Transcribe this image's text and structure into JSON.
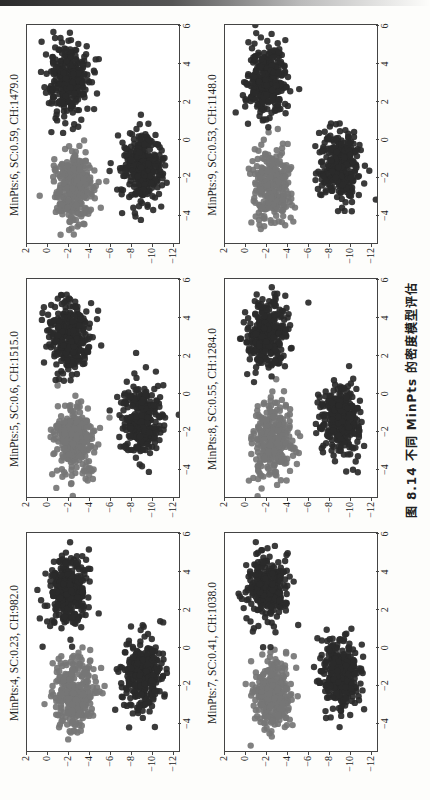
{
  "caption": "图 8.14  不同 MinPts 的密度模型评估",
  "colors": {
    "cluster_grey": "#767676",
    "cluster_dark": "#2a2a2a",
    "frame": "#444444"
  },
  "panels": [
    {
      "title": "MinPts:4, SC:0.23, CH:982.0"
    },
    {
      "title": "MinPts:5, SC:0.6, CH:1515.0"
    },
    {
      "title": "MinPts:6, SC:0.59, CH:1479.0"
    },
    {
      "title": "MinPts:7, SC:0.41, CH:1038.0"
    },
    {
      "title": "MinPts:8, SC:0.55, CH:1284.0"
    },
    {
      "title": "MinPts:9, SC:0.53, CH:1148.0"
    }
  ],
  "axes": {
    "x_ticks": [
      "−4",
      "−2",
      "0",
      "2",
      "4",
      "6"
    ],
    "y_ticks": [
      "2",
      "0",
      "−2",
      "−4",
      "−6",
      "−8",
      "−10",
      "−12"
    ]
  },
  "chart_data": [
    {
      "type": "scatter",
      "title": "MinPts:4, SC:0.23, CH:982.0",
      "xlabel": "",
      "ylabel": "",
      "xlim": [
        -5.5,
        6
      ],
      "ylim": [
        -12.5,
        2
      ],
      "x_ticks": [
        -4,
        -2,
        0,
        2,
        4,
        6
      ],
      "y_ticks": [
        2,
        0,
        -2,
        -4,
        -6,
        -8,
        -10,
        -12
      ],
      "grid": false,
      "series": [
        {
          "name": "cluster A (grey)",
          "center": [
            -2.5,
            -2.5
          ],
          "spread": [
            1.0,
            1.0
          ],
          "color": "#767676"
        },
        {
          "name": "cluster B (dark)",
          "center": [
            -1.5,
            -9.0
          ],
          "spread": [
            1.0,
            1.0
          ],
          "color": "#2a2a2a"
        },
        {
          "name": "cluster C (dark)",
          "center": [
            3.0,
            -2.0
          ],
          "spread": [
            1.0,
            1.0
          ],
          "color": "#2a2a2a"
        }
      ],
      "metrics": {
        "MinPts": 4,
        "SC": 0.23,
        "CH": 982.0
      }
    },
    {
      "type": "scatter",
      "title": "MinPts:5, SC:0.6, CH:1515.0",
      "xlim": [
        -5.5,
        6
      ],
      "ylim": [
        -12.5,
        2
      ],
      "x_ticks": [
        -4,
        -2,
        0,
        2,
        4,
        6
      ],
      "y_ticks": [
        2,
        0,
        -2,
        -4,
        -6,
        -8,
        -10,
        -12
      ],
      "grid": false,
      "series": [
        {
          "name": "cluster A (grey)",
          "center": [
            -2.5,
            -2.5
          ],
          "color": "#767676"
        },
        {
          "name": "cluster B (dark)",
          "center": [
            -1.5,
            -9.0
          ],
          "color": "#2a2a2a"
        },
        {
          "name": "cluster C (dark)",
          "center": [
            3.0,
            -2.0
          ],
          "color": "#2a2a2a"
        }
      ],
      "metrics": {
        "MinPts": 5,
        "SC": 0.6,
        "CH": 1515.0
      }
    },
    {
      "type": "scatter",
      "title": "MinPts:6, SC:0.59, CH:1479.0",
      "xlim": [
        -5.5,
        6
      ],
      "ylim": [
        -12.5,
        2
      ],
      "x_ticks": [
        -4,
        -2,
        0,
        2,
        4,
        6
      ],
      "y_ticks": [
        2,
        0,
        -2,
        -4,
        -6,
        -8,
        -10,
        -12
      ],
      "grid": false,
      "series": [
        {
          "name": "cluster A (grey)",
          "center": [
            -2.5,
            -2.5
          ],
          "color": "#767676"
        },
        {
          "name": "cluster B (dark)",
          "center": [
            -1.5,
            -9.0
          ],
          "color": "#2a2a2a"
        },
        {
          "name": "cluster C (dark)",
          "center": [
            3.0,
            -2.0
          ],
          "color": "#2a2a2a"
        }
      ],
      "metrics": {
        "MinPts": 6,
        "SC": 0.59,
        "CH": 1479.0
      }
    },
    {
      "type": "scatter",
      "title": "MinPts:7, SC:0.41, CH:1038.0",
      "xlim": [
        -5.5,
        6
      ],
      "ylim": [
        -12.5,
        2
      ],
      "x_ticks": [
        -4,
        -2,
        0,
        2,
        4,
        6
      ],
      "y_ticks": [
        2,
        0,
        -2,
        -4,
        -6,
        -8,
        -10,
        -12
      ],
      "grid": false,
      "series": [
        {
          "name": "cluster A (grey)",
          "center": [
            -2.5,
            -2.5
          ],
          "color": "#767676"
        },
        {
          "name": "cluster B (dark)",
          "center": [
            -1.5,
            -9.0
          ],
          "color": "#2a2a2a"
        },
        {
          "name": "cluster C (dark)",
          "center": [
            3.0,
            -2.0
          ],
          "color": "#2a2a2a"
        }
      ],
      "metrics": {
        "MinPts": 7,
        "SC": 0.41,
        "CH": 1038.0
      }
    },
    {
      "type": "scatter",
      "title": "MinPts:8, SC:0.55, CH:1284.0",
      "xlim": [
        -5.5,
        6
      ],
      "ylim": [
        -12.5,
        2
      ],
      "x_ticks": [
        -4,
        -2,
        0,
        2,
        4,
        6
      ],
      "y_ticks": [
        2,
        0,
        -2,
        -4,
        -6,
        -8,
        -10,
        -12
      ],
      "grid": false,
      "series": [
        {
          "name": "cluster A (grey)",
          "center": [
            -2.5,
            -2.5
          ],
          "color": "#767676"
        },
        {
          "name": "cluster B (dark)",
          "center": [
            -1.5,
            -9.0
          ],
          "color": "#2a2a2a"
        },
        {
          "name": "cluster C (dark)",
          "center": [
            3.0,
            -2.0
          ],
          "color": "#2a2a2a"
        }
      ],
      "metrics": {
        "MinPts": 8,
        "SC": 0.55,
        "CH": 1284.0
      }
    },
    {
      "type": "scatter",
      "title": "MinPts:9, SC:0.53, CH:1148.0",
      "xlim": [
        -5.5,
        6
      ],
      "ylim": [
        -12.5,
        2
      ],
      "x_ticks": [
        -4,
        -2,
        0,
        2,
        4,
        6
      ],
      "y_ticks": [
        2,
        0,
        -2,
        -4,
        -6,
        -8,
        -10,
        -12
      ],
      "grid": false,
      "series": [
        {
          "name": "cluster A (grey)",
          "center": [
            -2.5,
            -2.5
          ],
          "color": "#767676"
        },
        {
          "name": "cluster B (dark)",
          "center": [
            -1.5,
            -9.0
          ],
          "color": "#2a2a2a"
        },
        {
          "name": "cluster C (dark)",
          "center": [
            3.0,
            -2.0
          ],
          "color": "#2a2a2a"
        }
      ],
      "metrics": {
        "MinPts": 9,
        "SC": 0.53,
        "CH": 1148.0
      }
    }
  ]
}
